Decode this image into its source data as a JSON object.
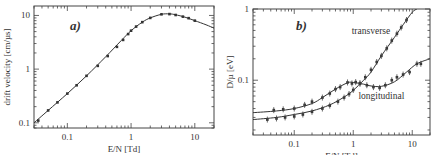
{
  "chart_data": [
    {
      "id": "a",
      "type": "line",
      "panel_label": "a)",
      "title": "",
      "xlabel": "E/N [Td]",
      "ylabel": "drift velocity [cm/µs]",
      "xscale": "log",
      "yscale": "log",
      "xlim": [
        0.03,
        20
      ],
      "ylim": [
        0.08,
        15
      ],
      "xticks": [
        {
          "v": 0.1,
          "label": "0.1"
        },
        {
          "v": 1,
          "label": "1"
        },
        {
          "v": 10,
          "label": "10"
        }
      ],
      "yticks": [
        {
          "v": 0.1,
          "label": "0.1"
        },
        {
          "v": 1,
          "label": "1"
        },
        {
          "v": 10,
          "label": "10"
        }
      ],
      "grid": false,
      "series": [
        {
          "name": "drift velocity (calculated)",
          "style": "line",
          "x": [
            0.03,
            0.05,
            0.1,
            0.2,
            0.4,
            0.7,
            1.0,
            1.5,
            2.0,
            3.0,
            4.0,
            5.0,
            7.0,
            10.0,
            15.0,
            20.0
          ],
          "y": [
            0.1,
            0.17,
            0.35,
            0.75,
            1.7,
            3.4,
            5.2,
            7.5,
            9.0,
            10.5,
            10.7,
            10.3,
            9.3,
            8.0,
            6.7,
            5.8
          ]
        },
        {
          "name": "drift velocity (measured)",
          "style": "points",
          "x": [
            0.035,
            0.05,
            0.07,
            0.1,
            0.14,
            0.2,
            0.3,
            0.43,
            0.6,
            0.75,
            0.9,
            1.0,
            1.2,
            1.5,
            2.0,
            3.0,
            4.0,
            5.0,
            6.5,
            8.0,
            10.0
          ],
          "y": [
            0.11,
            0.17,
            0.24,
            0.35,
            0.5,
            0.75,
            1.15,
            1.75,
            2.6,
            3.5,
            4.5,
            5.2,
            6.2,
            7.5,
            9.0,
            10.5,
            10.6,
            10.2,
            9.5,
            8.9,
            8.0
          ]
        }
      ]
    },
    {
      "id": "b",
      "type": "line",
      "panel_label": "b)",
      "title": "",
      "xlabel": "E/N [Td]",
      "ylabel": "D/µ [eV]",
      "xscale": "log",
      "yscale": "log",
      "xlim": [
        0.02,
        20
      ],
      "ylim": [
        0.017,
        1
      ],
      "xticks": [
        {
          "v": 0.1,
          "label": "0.1"
        },
        {
          "v": 1,
          "label": "1"
        },
        {
          "v": 10,
          "label": "10"
        }
      ],
      "yticks": [
        {
          "v": 0.1,
          "label": "0.1"
        },
        {
          "v": 1,
          "label": "1"
        }
      ],
      "grid": false,
      "annotations": [
        {
          "text": "transverse",
          "x": 2.0,
          "y": 0.45
        },
        {
          "text": "longitudinal",
          "x": 3.0,
          "y": 0.055
        }
      ],
      "series": [
        {
          "name": "transverse (calculated)",
          "style": "line",
          "x": [
            0.02,
            0.05,
            0.1,
            0.2,
            0.4,
            0.7,
            1.0,
            1.5,
            2.0,
            3.0,
            5.0,
            7.0,
            10.0,
            12.0
          ],
          "y": [
            0.028,
            0.03,
            0.033,
            0.037,
            0.045,
            0.058,
            0.072,
            0.1,
            0.13,
            0.22,
            0.4,
            0.6,
            0.9,
            1.0
          ]
        },
        {
          "name": "transverse (measured)",
          "style": "points",
          "x": [
            0.035,
            0.05,
            0.07,
            0.1,
            0.14,
            0.2,
            0.3,
            0.4,
            0.55,
            0.7,
            0.85,
            1.0,
            1.3,
            1.6,
            2.0,
            2.5,
            3.0,
            3.7,
            4.5,
            5.5,
            6.5,
            8.0
          ],
          "y": [
            0.028,
            0.029,
            0.03,
            0.031,
            0.033,
            0.036,
            0.04,
            0.044,
            0.05,
            0.057,
            0.064,
            0.073,
            0.09,
            0.11,
            0.14,
            0.18,
            0.22,
            0.28,
            0.36,
            0.45,
            0.55,
            0.7
          ]
        },
        {
          "name": "longitudinal (calculated)",
          "style": "line",
          "x": [
            0.02,
            0.05,
            0.1,
            0.2,
            0.3,
            0.5,
            0.8,
            1.0,
            1.5,
            2.0,
            3.0,
            5.0,
            8.0,
            12.0,
            20.0
          ],
          "y": [
            0.035,
            0.037,
            0.04,
            0.047,
            0.057,
            0.075,
            0.092,
            0.093,
            0.088,
            0.083,
            0.082,
            0.095,
            0.13,
            0.17,
            0.2
          ]
        },
        {
          "name": "longitudinal (measured)",
          "style": "points",
          "x": [
            0.045,
            0.065,
            0.1,
            0.15,
            0.2,
            0.3,
            0.4,
            0.5,
            0.6,
            0.8,
            0.95,
            1.1,
            1.3,
            1.7,
            2.2,
            2.8,
            3.5,
            4.5,
            5.5,
            7.0,
            9.0,
            12.0,
            14.0
          ],
          "y": [
            0.038,
            0.039,
            0.04,
            0.045,
            0.05,
            0.057,
            0.065,
            0.075,
            0.08,
            0.093,
            0.09,
            0.094,
            0.09,
            0.085,
            0.08,
            0.078,
            0.085,
            0.1,
            0.11,
            0.12,
            0.13,
            0.17,
            0.17
          ]
        }
      ]
    }
  ]
}
